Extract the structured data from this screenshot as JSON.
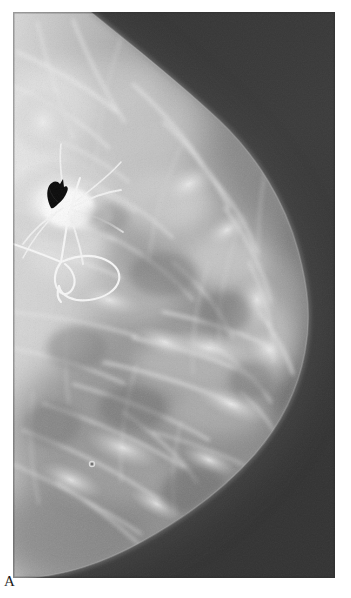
{
  "figure": {
    "modality": "mammogram",
    "panel_letter": "A",
    "background_color": "#ffffff",
    "plate": {
      "x": 13,
      "y": 12,
      "width": 322,
      "height": 566,
      "film_background_color": "#3a3a3a",
      "tissue_bright_color": "#e9e9e9",
      "tissue_mid_color": "#9a9a9a",
      "tissue_dark_color": "#5e5e5e"
    }
  },
  "annotations": {
    "arrow_marker": {
      "name": "black-arrow-marker",
      "color": "#0a0a0a",
      "x": 33,
      "y": 178,
      "width": 19,
      "height": 24,
      "points_to": "spiculated mass"
    },
    "localization_wire": {
      "name": "hookwire",
      "color": "#f2f2f2",
      "tip_x": 80,
      "tip_y": 178,
      "entry_x": 13,
      "entry_y": 244,
      "loop_x": 62,
      "loop_y": 262,
      "square_x": 96,
      "square_y": 258
    },
    "skin_marker_dot": {
      "name": "skin-marker-dot",
      "color": "#d8d8d8",
      "x": 92,
      "y": 464,
      "radius": 2.5
    }
  },
  "anatomy": {
    "breast_outline_label": "breast contour",
    "nipple_x": 289,
    "nipple_y": 322,
    "chest_wall_side": "left",
    "max_width_x": 292,
    "tissue_density": "heterogeneously dense"
  }
}
